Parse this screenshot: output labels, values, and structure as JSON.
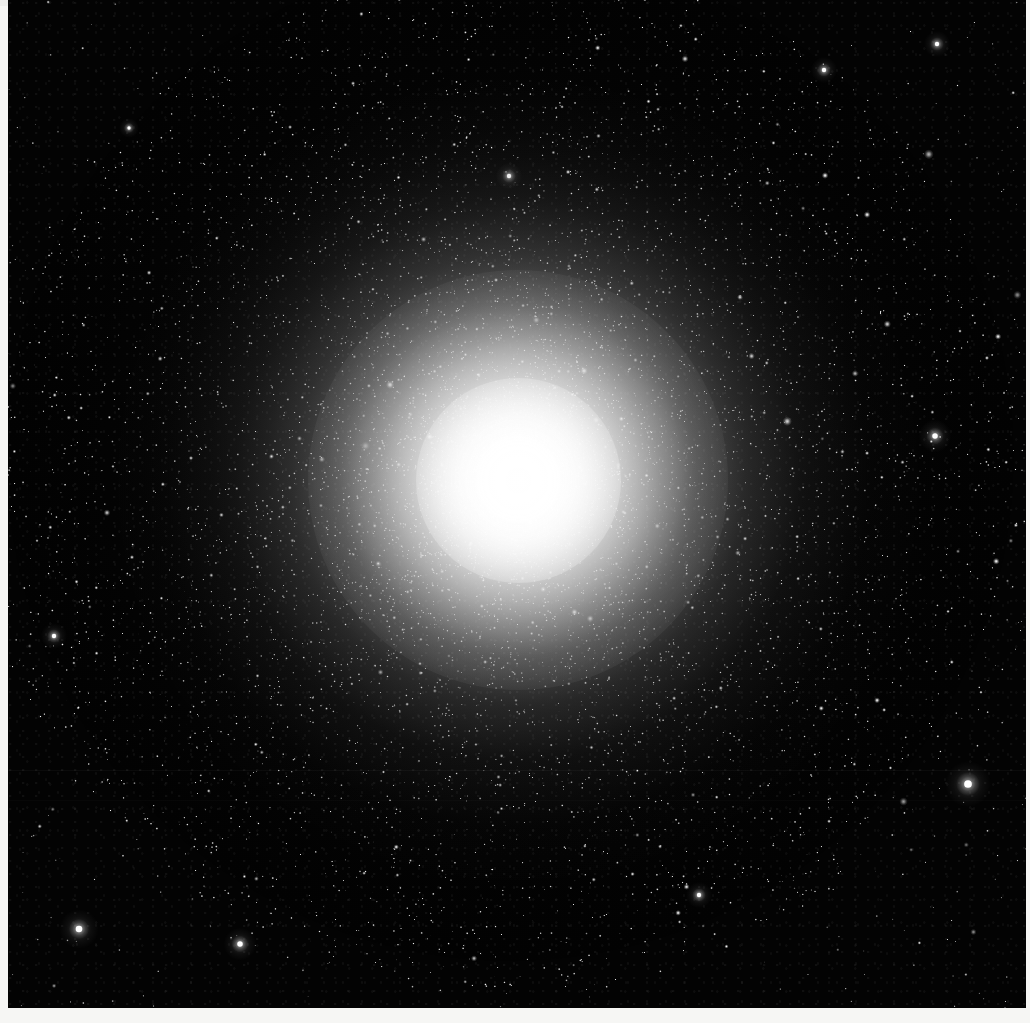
{
  "image": {
    "kind": "astronomical-photograph",
    "subject": "globular star cluster",
    "description": "Grayscale photographic plate of a dense globular star cluster. A saturated near-white unresolved core fills the centre of the frame, surrounded by a broad halo of individually resolved stars whose surface density falls off smoothly with radius, fading into a sparse field of foreground stars on a black sky.",
    "color_mode": "grayscale",
    "width_px": 1030,
    "height_px": 1023
  },
  "palette": {
    "sky_black": "#040404",
    "sky_deep": "#030303",
    "star_white": "#ffffff",
    "core_white": "#fdfdfd",
    "halo_gray": "#9a9a9a",
    "plate_border": "#f6f6f4"
  },
  "cluster": {
    "center_x_px": 510,
    "center_y_px": 480,
    "saturated_core_radius_px": 95,
    "bright_core_radius_px": 210,
    "resolved_halo_radius_px": 400,
    "outer_extent_radius_px": 520,
    "peak_brightness_level": 253,
    "background_sky_level": 4
  },
  "starfield": {
    "field_star_count": 900,
    "cluster_star_count": 11000,
    "description": "Sparse field stars scattered across the full frame plus a radially concentrated swarm of cluster members."
  },
  "bright_field_stars": [
    {
      "x": 968,
      "y": 784,
      "radius_px": 7,
      "note": "brightest isolated field star, lower right"
    },
    {
      "x": 79,
      "y": 929,
      "radius_px": 6,
      "note": "bright star, lower left"
    },
    {
      "x": 935,
      "y": 436,
      "radius_px": 5,
      "note": "bright star, right edge"
    },
    {
      "x": 240,
      "y": 944,
      "radius_px": 5,
      "note": "bright star, bottom"
    },
    {
      "x": 699,
      "y": 895,
      "radius_px": 4,
      "note": "bright star, lower centre-right"
    },
    {
      "x": 937,
      "y": 44,
      "radius_px": 4,
      "note": "bright star, top right"
    },
    {
      "x": 509,
      "y": 176,
      "radius_px": 4,
      "note": "bright star above core"
    },
    {
      "x": 54,
      "y": 636,
      "radius_px": 4,
      "note": "bright star, left edge"
    },
    {
      "x": 824,
      "y": 70,
      "radius_px": 4,
      "note": "bright star, top right"
    },
    {
      "x": 129,
      "y": 128,
      "radius_px": 3,
      "note": "bright star, upper left"
    }
  ],
  "plate_border": {
    "left_strip_width_px": 8,
    "bottom_strip_height_px": 15,
    "right_strip_width_px": 4,
    "description": "Unexposed white film/scan margin along the left, bottom and right edges of the plate."
  },
  "artifacts": {
    "scan_seams_y_px": [
      770,
      800
    ],
    "note": "Faint horizontal scan discontinuities in the lower half of the plate."
  }
}
